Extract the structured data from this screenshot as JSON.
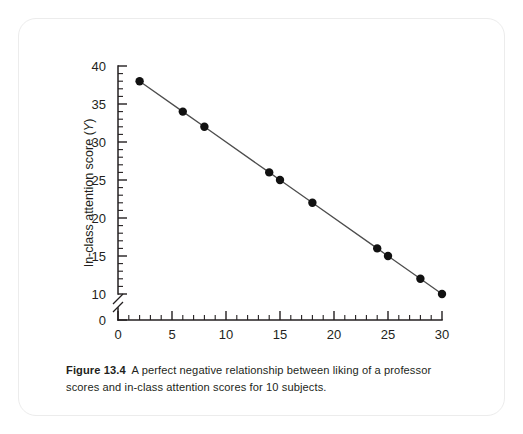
{
  "figure": {
    "caption_label": "Figure 13.4",
    "caption_text": "A perfect negative relationship between liking of a professor scores and in-class attention scores for 10 subjects."
  },
  "chart_data": {
    "type": "scatter",
    "title": "",
    "xlabel": "Liking of a professor score (X)",
    "ylabel": "In-class attention score (Y)",
    "xlabel_text": "Liking of a professor score",
    "xlabel_var": "X",
    "ylabel_text": "In-class attention score",
    "ylabel_var": "Y",
    "x": [
      2,
      6,
      8,
      14,
      15,
      18,
      24,
      25,
      28,
      30
    ],
    "y": [
      38,
      34,
      32,
      26,
      25,
      22,
      16,
      15,
      12,
      10
    ],
    "points": [
      {
        "x": 2,
        "y": 38
      },
      {
        "x": 6,
        "y": 34
      },
      {
        "x": 8,
        "y": 32
      },
      {
        "x": 14,
        "y": 26
      },
      {
        "x": 15,
        "y": 25
      },
      {
        "x": 18,
        "y": 22
      },
      {
        "x": 24,
        "y": 16
      },
      {
        "x": 25,
        "y": 15
      },
      {
        "x": 28,
        "y": 12
      },
      {
        "x": 30,
        "y": 10
      }
    ],
    "xlim": [
      0,
      30
    ],
    "ylim": [
      0,
      40
    ],
    "y_axis_break": true,
    "y_break_between": [
      0,
      10
    ],
    "x_ticks_major": [
      0,
      5,
      10,
      15,
      20,
      25,
      30
    ],
    "x_tick_labels": [
      "0",
      "5",
      "10",
      "15",
      "20",
      "25",
      "30"
    ],
    "x_tick_minor_step": 1,
    "y_ticks_major": [
      0,
      10,
      15,
      20,
      25,
      30,
      35,
      40
    ],
    "y_tick_labels": [
      "0",
      "10",
      "15",
      "20",
      "25",
      "30",
      "35",
      "40"
    ],
    "y_tick_minor_step": 1,
    "grid": false,
    "legend": false,
    "series_color": "#111111",
    "line_color": "#4d4d4d",
    "n_subjects": 10
  }
}
